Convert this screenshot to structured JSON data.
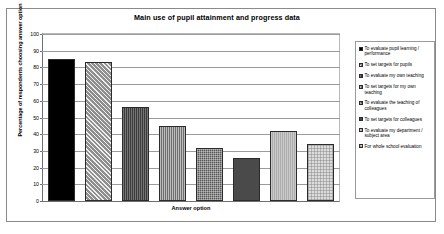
{
  "chart_data": {
    "type": "bar",
    "title": "Main use of pupil attainment and progress data",
    "xlabel": "Answer option",
    "ylabel": "Percentage of respondents choosing answer option",
    "ylim": [
      0,
      100
    ],
    "ytick_labels": [
      "100",
      "90",
      "80",
      "70",
      "60",
      "50",
      "40",
      "30",
      "20",
      "10",
      "0"
    ],
    "ytick_values": [
      100,
      90,
      80,
      70,
      60,
      50,
      40,
      30,
      20,
      10,
      0
    ],
    "grid": true,
    "legend_position": "right",
    "categories": [
      "To evaluate pupil learning / performance",
      "To set targets for pupils",
      "To evaluate my own teaching",
      "To set targets for my own teaching",
      "To evaluate the teaching of colleagues",
      "To set targets for colleagues",
      "To evaluate my department / subject area",
      "For whole school evaluation"
    ],
    "values": [
      85,
      83,
      56,
      45,
      32,
      26,
      42,
      34
    ]
  },
  "legend": {
    "items": [
      {
        "label": "To evaluate pupil learning / performance"
      },
      {
        "label": "To set targets for pupils"
      },
      {
        "label": "To evaluate my own teaching"
      },
      {
        "label": "To set targets for my own teaching"
      },
      {
        "label": "To evaluate the teaching of colleagues"
      },
      {
        "label": "To set targets for colleagues"
      },
      {
        "label": "To evaluate my department / subject area"
      },
      {
        "label": "For whole school evaluation"
      }
    ]
  }
}
